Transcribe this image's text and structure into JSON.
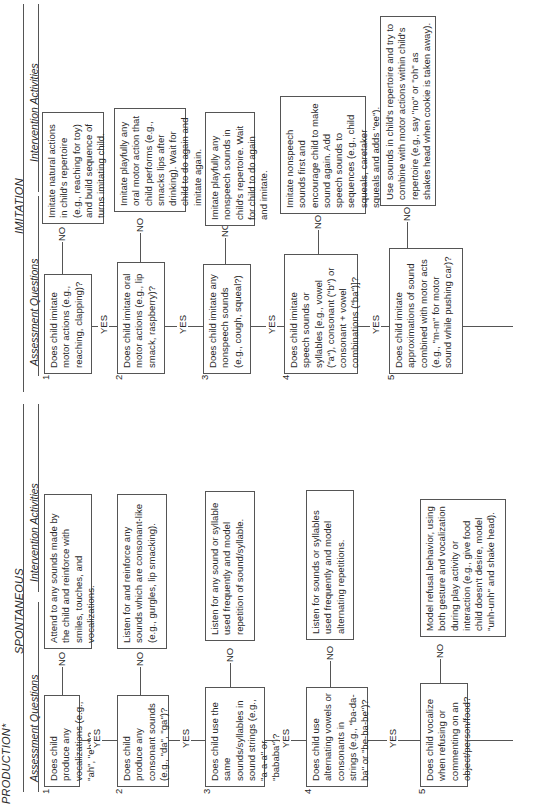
{
  "page_title": "PRODUCTION*",
  "sections": {
    "spontaneous": {
      "title": "SPONTANEOUS",
      "col_questions": "Assessment Questions",
      "col_activities": "Intervention Activities",
      "rows": [
        {
          "num": "1",
          "question": "Does child produce any vocalizations (e.g., \"ah\", \"eh\")?",
          "activity": "Attend to any sounds made by the child and reinforce with smiles, touches, and vocalizations."
        },
        {
          "num": "2",
          "question": "Does child produce any consonant sounds (e.g., \"da\", \"ga\")?",
          "activity": "Listen for and reinforce any sounds which are consonant-like (e.g., gurgles, lip smacking)."
        },
        {
          "num": "3",
          "question": "Does child use the same sounds/syllables in sound strings (e.g., \"a-a-a\" or \"bababa\")?",
          "activity": "Listen for any sound or syllable used frequently and model repetition of sound/syllable."
        },
        {
          "num": "4",
          "question": "Does child use alternating vowels or consonants in strings (e.g., \"ba-da-ba\" or \"be-ba-be\")?",
          "activity": "Listen for sounds or syllables used frequently and model alternating repetitions."
        },
        {
          "num": "5",
          "question": "Does child vocalize when refusing or commenting on an object/person/food?",
          "activity": "Model refusal behavior, using both gesture and vocalization during play activity or interaction (e.g., give food child doesn't desire, model \"unh-unh\" and shake head)."
        }
      ]
    },
    "imitation": {
      "title": "IMITATION",
      "col_questions": "Assessment Questions",
      "col_activities": "Intervention Activities",
      "rows": [
        {
          "num": "1",
          "question": "Does child imitate motor actions (e.g., reaching, clapping)?",
          "activity": "Imitate natural actions in child's repertoire (e.g., reaching for toy) and build sequence of turns imitating child."
        },
        {
          "num": "2",
          "question": "Does child imitate oral motor actions (e.g., lip smack, raspberry)?",
          "activity": "Imitate playfully any oral motor action that child performs (e.g., smacks lips after drinking). Wait for child to do again and imitate again."
        },
        {
          "num": "3",
          "question": "Does child imitate any nonspeech sounds (e.g., cough, squeal?)",
          "activity": "Imitate playfully any nonspeech sounds in child's repertoire. Wait for child to do again and imitate."
        },
        {
          "num": "4",
          "question": "Does child imitate speech sounds or syllables [e.g., vowel (\"a\"), consonant (\"b\") or consonant + vowel combinations (\"ba\")]?",
          "activity": "Imitate nonspeech sounds first and encourage child to make sound again. Add speech sounds to sequences (e.g., child squeals, caretaker squeals and adds \"ee\")."
        },
        {
          "num": "5",
          "question": "Does child imitate approximations of sound combined with motor acts (e.g., \"m-m\" for motor sound while pushing car)?",
          "activity": "Use sounds in child's repertoire and try to combine with motor actions within child's repertoire (e.g., say \"no\" or \"oh\" as shakes head when cookie is taken away)."
        }
      ]
    }
  },
  "labels": {
    "yes": "YES",
    "no": "NO"
  }
}
